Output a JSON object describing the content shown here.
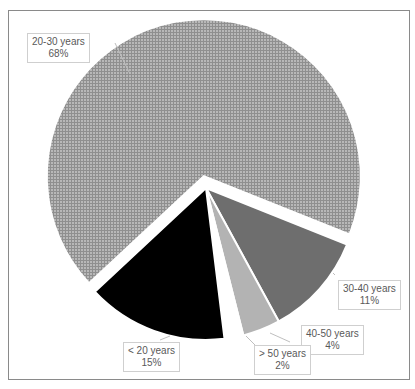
{
  "chart_data": {
    "type": "pie",
    "title": "",
    "categories": [
      "20-30 years",
      "30-40 years",
      "40-50 years",
      "> 50 years",
      "< 20 years"
    ],
    "values": [
      68,
      11,
      4,
      2,
      15
    ],
    "units": "%",
    "labels": [
      {
        "category": "20-30 years",
        "percent": "68%"
      },
      {
        "category": "30-40 years",
        "percent": "11%"
      },
      {
        "category": "40-50 years",
        "percent": "4%"
      },
      {
        "category": "> 50 years",
        "percent": "2%"
      },
      {
        "category": "< 20 years",
        "percent": "15%"
      }
    ],
    "colors": [
      "#a6a6a6",
      "#6e6e6e",
      "#b3b3b3",
      "#ffffff",
      "#000000"
    ],
    "patterns": [
      "grid-hatch",
      "solid",
      "solid",
      "solid",
      "solid"
    ],
    "exploded": [
      "20-30 years"
    ],
    "legend": "none (data callouts)",
    "grid": false
  }
}
